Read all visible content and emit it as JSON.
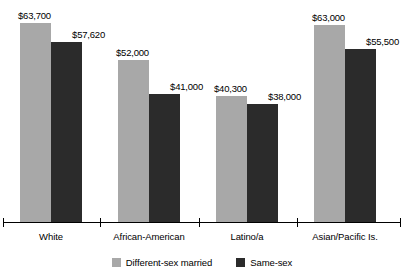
{
  "chart_data": {
    "type": "bar",
    "title": "",
    "subtitle": "",
    "xlabel": "",
    "ylabel": "",
    "grid": false,
    "legend_position": "bottom-center",
    "ylim": [
      0,
      63700
    ],
    "categories": [
      "White",
      "African-American",
      "Latino/a",
      "Asian/Pacific Is."
    ],
    "series": [
      {
        "name": "Different-sex married",
        "color": "#a8a8a8",
        "values": [
          63700,
          52000,
          40300,
          63000
        ],
        "labels": [
          "$63,700",
          "$52,000",
          "$40,300",
          "$63,000"
        ]
      },
      {
        "name": "Same-sex",
        "color": "#2b2b2b",
        "values": [
          57620,
          41000,
          38000,
          55500
        ],
        "labels": [
          "$57,620",
          "$41,000",
          "$38,000",
          "$55,500"
        ]
      }
    ]
  },
  "axis": {
    "line_color": "#000000",
    "tick_count": 5
  }
}
